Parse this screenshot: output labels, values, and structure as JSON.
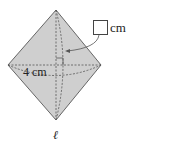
{
  "figure": {
    "shape": "double cone / rhombus cross-section",
    "fill_color": "#cfcfcf",
    "stroke_color": "#555555",
    "answer_box": {
      "value": "",
      "unit": "cm"
    },
    "labels": {
      "horizontal_length": "4 cm",
      "bottom_letter": "ℓ"
    }
  }
}
